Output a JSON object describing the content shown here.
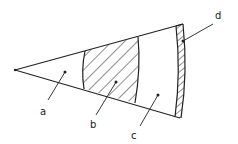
{
  "diagram": {
    "type": "sector-regions",
    "regions": [
      {
        "id": "a",
        "label": "a",
        "fill": "plain"
      },
      {
        "id": "b",
        "label": "b",
        "fill": "diagonal-hatch"
      },
      {
        "id": "c",
        "label": "c",
        "fill": "plain"
      },
      {
        "id": "d",
        "label": "d",
        "fill": "dense-hatch"
      }
    ],
    "colors": {
      "stroke": "#222222",
      "background": "#ffffff"
    }
  }
}
